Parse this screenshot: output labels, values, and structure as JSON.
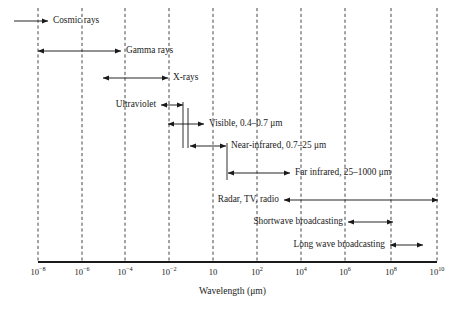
{
  "figure": {
    "axis_title": "Wavelength (μm)",
    "line_color": "#1a1a1a",
    "grid_color": "#333333",
    "background": "#ffffff"
  },
  "chart_data": {
    "type": "bar",
    "title": "",
    "xlabel": "Wavelength (μm)",
    "ylabel": "",
    "scale": "log",
    "xlim": [
      1e-08,
      10000000000.0
    ],
    "grid": true,
    "legend": "none",
    "categories": [
      "Cosmic rays",
      "Gamma rays",
      "X-rays",
      "Ultraviolet",
      "Visible, 0.4–0.7 μm",
      "Near-infrared, 0.7–25 μm",
      "Far infrared, 25–1000 μm",
      "Radar, TV, radio",
      "Shortwave broadcasting",
      "Long wave broadcasting"
    ],
    "tick_labels": [
      "10⁻⁸",
      "10⁻⁶",
      "10⁻⁴",
      "10⁻²",
      "10",
      "10²",
      "10⁴",
      "10⁶",
      "10⁸",
      "10¹⁰"
    ],
    "tick_exponents": [
      -8,
      -6,
      -4,
      -2,
      1,
      2,
      4,
      6,
      8,
      10
    ],
    "bands": [
      {
        "name": "Cosmic rays",
        "label": "Cosmic rays",
        "x_start_px": 14,
        "x_end_px": 48,
        "y_px": 21,
        "arrow_start": false,
        "arrow_end": true,
        "label_side": "right"
      },
      {
        "name": "Gamma rays",
        "label": "Gamma rays",
        "x_start_px": 38,
        "x_end_px": 121,
        "y_px": 51,
        "arrow_start": true,
        "arrow_end": true,
        "label_side": "right"
      },
      {
        "name": "X-rays",
        "label": "X-rays",
        "x_start_px": 103,
        "x_end_px": 168,
        "y_px": 78,
        "arrow_start": true,
        "arrow_end": true,
        "label_side": "right"
      },
      {
        "name": "Ultraviolet",
        "label": "Ultraviolet",
        "x_start_px": 161,
        "x_end_px": 183,
        "y_px": 105,
        "arrow_start": true,
        "arrow_end": true,
        "label_side": "left"
      },
      {
        "name": "Visible",
        "label": "Visible, 0.4–0.7 μm",
        "x_start_px": 168,
        "x_end_px": 204,
        "y_px": 124,
        "arrow_start": true,
        "arrow_end": true,
        "label_side": "right"
      },
      {
        "name": "Near-infrared",
        "label": "Near-infrared, 0.7–25 μm",
        "x_start_px": 190,
        "x_end_px": 226,
        "y_px": 146,
        "arrow_start": true,
        "arrow_end": true,
        "label_side": "right"
      },
      {
        "name": "Far infrared",
        "label": "Far infrared, 25–1000 μm",
        "x_start_px": 228,
        "x_end_px": 290,
        "y_px": 173,
        "arrow_start": true,
        "arrow_end": true,
        "label_side": "right"
      },
      {
        "name": "Radar TV radio",
        "label": "Radar, TV, radio",
        "x_start_px": 284,
        "x_end_px": 438,
        "y_px": 200,
        "arrow_start": true,
        "arrow_end": true,
        "label_side": "left"
      },
      {
        "name": "Shortwave broadcasting",
        "label": "Shortwave broadcasting",
        "x_start_px": 348,
        "x_end_px": 393,
        "y_px": 222,
        "arrow_start": true,
        "arrow_end": true,
        "label_side": "left"
      },
      {
        "name": "Long wave broadcasting",
        "label": "Long wave broadcasting",
        "x_start_px": 390,
        "x_end_px": 423,
        "y_px": 245,
        "arrow_start": true,
        "arrow_end": true,
        "label_side": "left"
      }
    ],
    "connectors": [
      {
        "name": "uv-visible-divider",
        "x_px": 183,
        "y1_px": 102,
        "y2_px": 148
      },
      {
        "name": "visible-nearir-divider",
        "x_px": 188,
        "y1_px": 108,
        "y2_px": 148
      },
      {
        "name": "nearir-farir-divider",
        "x_px": 227,
        "y1_px": 143,
        "y2_px": 180
      }
    ],
    "gridline_x_px": [
      38,
      82,
      125,
      169,
      213,
      257,
      301,
      345,
      391,
      437
    ],
    "axis_y_px": 262,
    "axis_x_start_px": 38,
    "axis_x_end_px": 437,
    "grid_top_px": 8
  }
}
